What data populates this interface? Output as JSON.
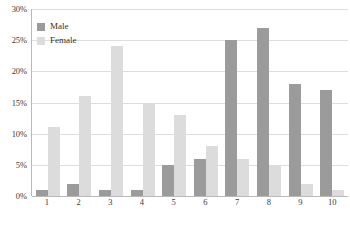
{
  "chart_data": {
    "type": "bar",
    "title": "",
    "xlabel": "",
    "ylabel": "",
    "categories": [
      "1",
      "2",
      "3",
      "4",
      "5",
      "6",
      "7",
      "8",
      "9",
      "10"
    ],
    "series": [
      {
        "name": "Male",
        "color": "#9b9b9b",
        "values": [
          1,
          2,
          1,
          1,
          5,
          6,
          25,
          27,
          18,
          17
        ]
      },
      {
        "name": "Female",
        "color": "#dcdcdc",
        "values": [
          11,
          16,
          24,
          15,
          13,
          8,
          6,
          5,
          2,
          1
        ]
      }
    ],
    "ylim": [
      0,
      30
    ],
    "ytick_values": [
      0,
      5,
      10,
      15,
      20,
      25,
      30
    ],
    "ytick_labels": [
      "0%",
      "5%",
      "10%",
      "15%",
      "20%",
      "25%",
      "30%"
    ],
    "grid": true,
    "legend_position": "top-left",
    "value_unit": "%",
    "axis_color": "#b9b9b9",
    "grid_color": "#dededd"
  }
}
